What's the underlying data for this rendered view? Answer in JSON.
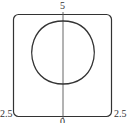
{
  "diagram": {
    "labels": {
      "top": "5",
      "bottom": "0",
      "bottom_left": "2.5",
      "bottom_right": "2.5"
    },
    "colors": {
      "stroke": "#333333",
      "axis": "#555555",
      "background": "#ffffff"
    },
    "shapes": [
      "rounded-square-frame",
      "vertical-axis",
      "closed-squircle-curve"
    ]
  }
}
